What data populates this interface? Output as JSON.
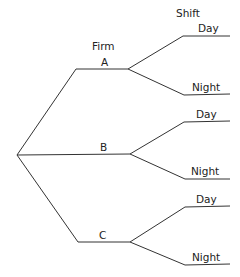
{
  "diagram": {
    "type": "tree",
    "headers": {
      "level1": "Firm",
      "level2": "Shift"
    },
    "branches": [
      {
        "label": "A",
        "children": [
          "Day",
          "Night"
        ]
      },
      {
        "label": "B",
        "children": [
          "Day",
          "Night"
        ]
      },
      {
        "label": "C",
        "children": [
          "Day",
          "Night"
        ]
      }
    ],
    "line_color": "#333333"
  }
}
